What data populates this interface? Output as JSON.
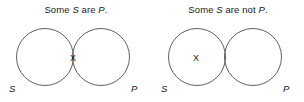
{
  "figure": {
    "width": 304,
    "height": 102,
    "background_color": "#ffffff",
    "stroke_color": "#4d4d4d",
    "text_color": "#1a1a1a"
  },
  "panels": [
    {
      "title_prefix": "Some ",
      "title_subject": "S",
      "title_middle": " are ",
      "title_predicate": "P",
      "title_suffix": ".",
      "title_full": "Some S are P.",
      "left_label": "S",
      "right_label": "P",
      "x_mark": "X",
      "x_region": "overlap"
    },
    {
      "title_prefix": "Some ",
      "title_subject": "S",
      "title_middle": " are not ",
      "title_predicate": "P",
      "title_suffix": ".",
      "title_full": "Some S are not P.",
      "left_label": "S",
      "right_label": "P",
      "x_mark": "X",
      "x_region": "subject-only"
    }
  ],
  "geometry": {
    "circle_radius": 28.5,
    "left_circle_cx": 45,
    "right_circle_cx": 101,
    "circle_cy": 37
  }
}
